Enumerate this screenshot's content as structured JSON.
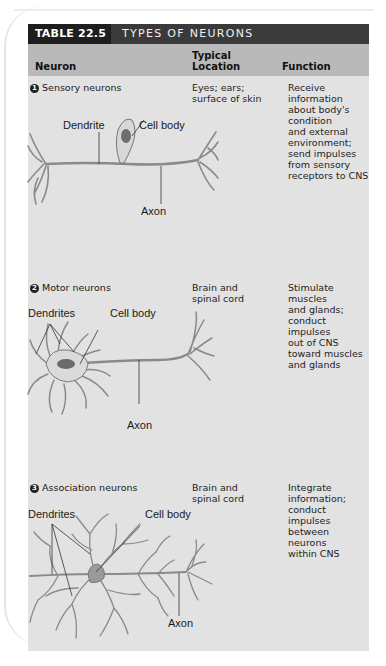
{
  "table": {
    "number": "TABLE 22.5",
    "title": "TYPES OF NEURONS",
    "headers": {
      "neuron": "Neuron",
      "location_line1": "Typical",
      "location_line2": "Location",
      "function": "Function"
    },
    "rows": [
      {
        "badge": "1",
        "name": "Sensory neurons",
        "location": [
          "Eyes; ears;",
          "surface of skin"
        ],
        "function": [
          "Receive",
          "information",
          "about body's",
          "condition",
          "and external",
          "environment;",
          "send impulses",
          "from sensory",
          "receptors to CNS"
        ],
        "labels": {
          "dendrite": "Dendrite",
          "cell_body": "Cell body",
          "axon": "Axon"
        }
      },
      {
        "badge": "2",
        "name": "Motor neurons",
        "location": [
          "Brain and",
          "spinal cord"
        ],
        "function": [
          "Stimulate muscles",
          "and glands;",
          "conduct impulses",
          "out of CNS",
          "toward muscles",
          "and glands"
        ],
        "labels": {
          "dendrites": "Dendrites",
          "cell_body": "Cell body",
          "axon": "Axon"
        }
      },
      {
        "badge": "3",
        "name": "Association neurons",
        "location": [
          "Brain and",
          "spinal cord"
        ],
        "function": [
          "Integrate",
          "information;",
          "conduct impulses",
          "between neurons",
          "within CNS"
        ],
        "labels": {
          "dendrites": "Dendrites",
          "cell_body": "Cell body",
          "axon": "Axon"
        }
      }
    ]
  },
  "colors": {
    "title_bar_dark": "#1e1e1e",
    "title_bar": "#3a3a3a",
    "header_row": "#b9b9b9",
    "body": "#e2e2e2"
  }
}
